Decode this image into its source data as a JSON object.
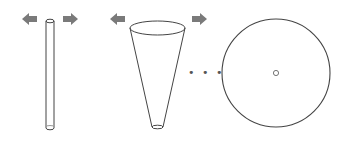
{
  "diagram": {
    "stages": [
      {
        "id": "tube",
        "label": ""
      },
      {
        "id": "cone",
        "label": ""
      },
      {
        "id": "disc",
        "label": ""
      }
    ],
    "ellipsis": "• • •",
    "arrow_color": "#7a7a7a",
    "stroke_color": "#333333",
    "arrows": [
      {
        "direction": "left",
        "near": "tube"
      },
      {
        "direction": "right",
        "near": "tube"
      },
      {
        "direction": "left",
        "near": "cone"
      },
      {
        "direction": "right",
        "near": "cone"
      }
    ]
  }
}
